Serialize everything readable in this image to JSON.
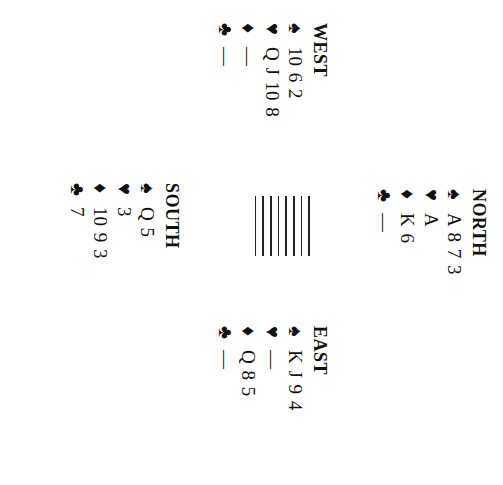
{
  "deal": {
    "north": {
      "label": "NORTH",
      "suits": [
        {
          "suit": "spades",
          "glyph": "♠",
          "cards": "A 8 7 3"
        },
        {
          "suit": "hearts",
          "glyph": "♥",
          "cards": "A"
        },
        {
          "suit": "diamonds",
          "glyph": "♦",
          "cards": "K 6"
        },
        {
          "suit": "clubs",
          "glyph": "♣",
          "cards": "—"
        }
      ]
    },
    "west": {
      "label": "WEST",
      "suits": [
        {
          "suit": "spades",
          "glyph": "♠",
          "cards": "10 6 2"
        },
        {
          "suit": "hearts",
          "glyph": "♥",
          "cards": "Q J 10 8"
        },
        {
          "suit": "diamonds",
          "glyph": "♦",
          "cards": "—"
        },
        {
          "suit": "clubs",
          "glyph": "♣",
          "cards": "—"
        }
      ]
    },
    "east": {
      "label": "EAST",
      "suits": [
        {
          "suit": "spades",
          "glyph": "♠",
          "cards": "K J 9 4"
        },
        {
          "suit": "hearts",
          "glyph": "♥",
          "cards": "—"
        },
        {
          "suit": "diamonds",
          "glyph": "♦",
          "cards": "Q 8 5"
        },
        {
          "suit": "clubs",
          "glyph": "♣",
          "cards": "—"
        }
      ]
    },
    "south": {
      "label": "SOUTH",
      "suits": [
        {
          "suit": "spades",
          "glyph": "♠",
          "cards": "Q 5"
        },
        {
          "suit": "hearts",
          "glyph": "♥",
          "cards": "3"
        },
        {
          "suit": "diamonds",
          "glyph": "♦",
          "cards": "10 9 3"
        },
        {
          "suit": "clubs",
          "glyph": "♣",
          "cards": "7"
        }
      ]
    },
    "table": {
      "line_count": 8
    },
    "orientation": "rotated 90° clockwise"
  }
}
